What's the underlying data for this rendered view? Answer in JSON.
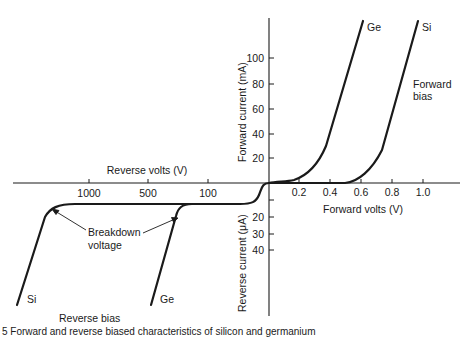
{
  "figure": {
    "caption_partial": "5  Forward and reverse biased characteristics of silicon and germanium",
    "axes": {
      "reverse_volts_label": "Reverse volts (V)",
      "forward_volts_label": "Forward volts (V)",
      "forward_current_label": "Forward current (mA)",
      "reverse_current_label": "Reverse current (μA)",
      "reverse_volts_ticks": [
        "1000",
        "500",
        "100"
      ],
      "forward_volts_ticks": [
        "0.2",
        "0.4",
        "0.6",
        "0.8",
        "1.0"
      ],
      "forward_current_ticks": [
        "20",
        "40",
        "60",
        "80",
        "100"
      ],
      "reverse_current_ticks": [
        "20",
        "30",
        "40"
      ]
    },
    "annotations": {
      "breakdown": [
        "Breakdown",
        "voltage"
      ],
      "forward_bias": [
        "Forward",
        "bias"
      ],
      "reverse_bias": "Reverse bias"
    },
    "curves": {
      "ge_forward_label": "Ge",
      "si_forward_label": "Si",
      "ge_reverse_label": "Ge",
      "si_reverse_label": "Si"
    },
    "colors": {
      "ink": "#1a1a1a",
      "background": "#ffffff"
    }
  }
}
